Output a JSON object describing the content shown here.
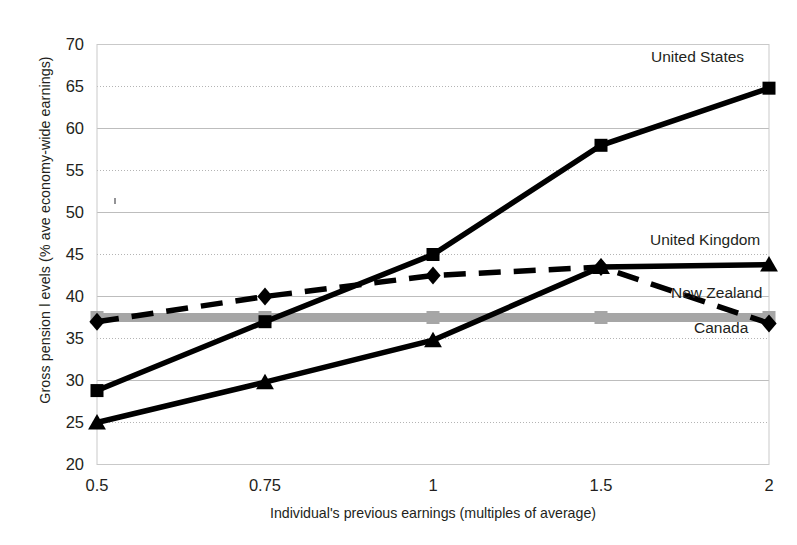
{
  "figure": {
    "title_cropped": "",
    "background": "#ffffff"
  },
  "axes": {
    "ylabel": "Gross pension l evels (% ave economy-wide earnings)",
    "xlabel": "Individual's previous earnings (multiples of average)",
    "yticks": [
      "70",
      "65",
      "60",
      "55",
      "50",
      "45",
      "40",
      "35",
      "30",
      "25",
      "20"
    ],
    "xticks": [
      "0.5",
      "0.75",
      "1",
      "1.5",
      "2"
    ]
  },
  "series_labels": {
    "united_states": "United States",
    "united_kingdom": "United Kingdom",
    "new_zealand": "New Zealand",
    "canada": "Canada"
  },
  "chart_data": {
    "type": "line",
    "title": "",
    "xlabel": "Individual's previous earnings (multiples of average)",
    "ylabel": "Gross pension l evels (% ave economy-wide earnings)",
    "categories": [
      "0.5",
      "0.75",
      "1",
      "1.5",
      "2"
    ],
    "x": [
      0.5,
      0.75,
      1,
      1.5,
      2
    ],
    "ylim": [
      20,
      70
    ],
    "ytick_step": 5,
    "grid": "horizontal-dotted",
    "legend": "inline-right-end-labels",
    "series": [
      {
        "name": "United States",
        "values": [
          28.8,
          37.0,
          45.0,
          58.0,
          64.8
        ],
        "color": "#000000",
        "marker": "square",
        "linestyle": "solid"
      },
      {
        "name": "United Kingdom",
        "values": [
          25.0,
          29.8,
          34.8,
          43.5,
          43.8
        ],
        "color": "#000000",
        "marker": "triangle",
        "linestyle": "solid"
      },
      {
        "name": "New Zealand",
        "values": [
          37.5,
          37.5,
          37.5,
          37.5,
          37.5
        ],
        "color": "#a6a6a6",
        "marker": "square",
        "linestyle": "solid"
      },
      {
        "name": "Canada",
        "values": [
          37.0,
          40.0,
          42.5,
          43.5,
          36.8
        ],
        "color": "#000000",
        "marker": "diamond",
        "linestyle": "dashed"
      }
    ]
  }
}
